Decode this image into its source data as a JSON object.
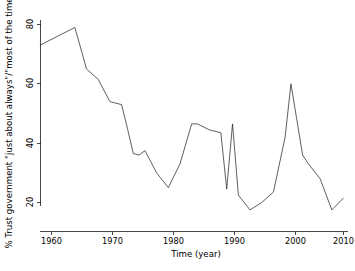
{
  "chart_data": {
    "type": "line",
    "title": "",
    "xlabel": "Time (year)",
    "ylabel": "% Trust government \"just about always\"/\"most of the time\"",
    "xlim": [
      1957.5,
      2010.5
    ],
    "ylim": [
      15.5,
      81.5
    ],
    "xticks": [
      1960,
      1970,
      1980,
      1990,
      2000,
      2010
    ],
    "xticklabels": [
      "1960",
      "1970",
      "1980",
      "1990",
      "2000",
      "2010"
    ],
    "yticks": [
      20,
      40,
      60,
      80
    ],
    "yticklabels": [
      "20",
      "40",
      "60",
      "80"
    ],
    "grid": false,
    "legend": false,
    "legend_position": "none",
    "line_color": "#2a2a2a",
    "background_color": "#ffffff",
    "series": [
      {
        "name": "% Trust government \"just about always\"/\"most of the time\"",
        "x": [
          1958,
          1964,
          1966,
          1968,
          1970,
          1972,
          1973,
          1974,
          1975,
          1976,
          1978,
          1980,
          1982,
          1984,
          1985,
          1987,
          1988,
          1989,
          1990,
          1991,
          1992,
          1994,
          1996,
          1998,
          2000,
          2001,
          2002,
          2003,
          2004,
          2006,
          2008,
          2010
        ],
        "values": [
          73.0,
          79.0,
          65.0,
          61.5,
          54.0,
          53.0,
          45.0,
          36.5,
          36.0,
          37.5,
          30.0,
          25.0,
          33.0,
          46.5,
          46.5,
          44.5,
          44.0,
          43.5,
          24.5,
          46.5,
          22.5,
          17.5,
          20.0,
          23.5,
          42.0,
          60.0,
          48.0,
          36.0,
          33.0,
          28.0,
          17.5,
          21.5
        ]
      }
    ]
  },
  "axes": {
    "x_axis_label": "Time (year)",
    "y_axis_label": "% Trust government \"just about always\"/\"most of the time\""
  }
}
